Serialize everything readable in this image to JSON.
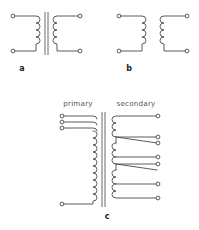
{
  "figure": {
    "background_color": "#ffffff",
    "line_color": "#4a4a4a",
    "label_color": "#1c1c1c",
    "heading_color": "#555555"
  },
  "panels": [
    {
      "id": "a",
      "label": "a",
      "kind": "iron-core transformer",
      "label_x": 22,
      "label_y": 71,
      "core": {
        "present": true,
        "lines": 2
      },
      "primary": {
        "turns": 4,
        "terminals": 2
      },
      "secondary": {
        "turns": 4,
        "terminals": 2
      }
    },
    {
      "id": "b",
      "label": "b",
      "kind": "air-core transformer",
      "label_x": 129,
      "label_y": 71,
      "core": {
        "present": false,
        "lines": 0
      },
      "primary": {
        "turns": 4,
        "terminals": 2
      },
      "secondary": {
        "turns": 4,
        "terminals": 2
      }
    },
    {
      "id": "c",
      "label": "c",
      "kind": "multi-tap iron-core transformer",
      "label_x": 107,
      "label_y": 219,
      "core": {
        "present": true,
        "lines": 2
      },
      "headings": {
        "primary": "primary",
        "secondary": "secondary",
        "primary_x": 78,
        "secondary_x": 136,
        "heading_y": 106
      },
      "primary": {
        "turns": 13,
        "top_taps": 3,
        "bottom_terminals": 1
      },
      "secondary": {
        "turns": 13,
        "taps": 7
      }
    }
  ],
  "terminals": {
    "radius": 1.9,
    "fill": "#ffffff",
    "stroke": "#4a4a4a"
  }
}
